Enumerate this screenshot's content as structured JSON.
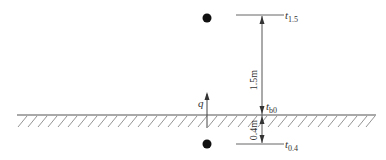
{
  "diagram": {
    "labels": {
      "t_1_5": {
        "symbol": "t",
        "subscript": "1.5"
      },
      "t_0": {
        "symbol": "t",
        "subscript": "b0"
      },
      "t_0_4": {
        "symbol": "t",
        "subscript": "0.4"
      },
      "heat_flux": "q"
    },
    "dimensions": {
      "above": "1.5m",
      "below": "0.4m"
    },
    "colors": {
      "line": "#555555",
      "dot": "#111111",
      "hatch": "#777777"
    }
  }
}
